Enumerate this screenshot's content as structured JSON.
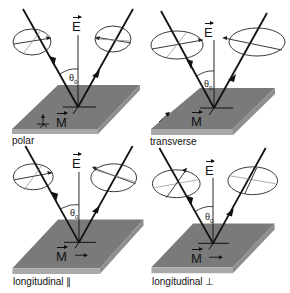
{
  "figure": {
    "colors": {
      "slab_top": "#7a7a7a",
      "slab_front": "#a9a9a9",
      "slab_side": "#8e8e8e",
      "line": "#111111",
      "ellipse_line": "#222222",
      "ellipse_inner": "#8a8a8a"
    },
    "symbols": {
      "field_label": "E",
      "magnetization_label": "M",
      "angle_label": "θ0",
      "angle_symbol": "θ",
      "angle_subscript": "0"
    },
    "panels": [
      {
        "id": "polar",
        "label": "polar",
        "magnetization": "out-of-plane (normal to surface)"
      },
      {
        "id": "transverse",
        "label": "transverse",
        "magnetization": "in-plane, perpendicular to plane of incidence"
      },
      {
        "id": "longitudinal-parallel",
        "label": "longitudinal ∥",
        "magnetization": "in-plane, parallel to plane of incidence"
      },
      {
        "id": "longitudinal-perpendicular",
        "label": "longitudinal ⊥",
        "magnetization": "in-plane, parallel to plane of incidence"
      }
    ]
  }
}
